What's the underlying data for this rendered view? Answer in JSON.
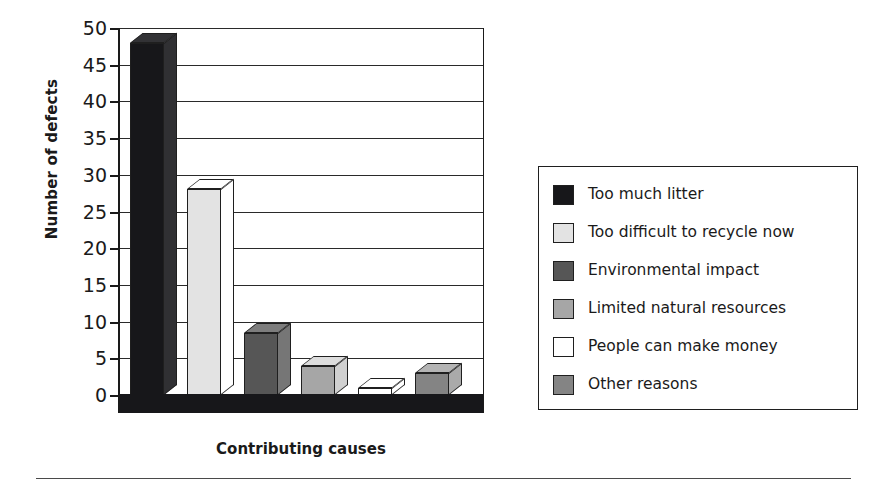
{
  "chart_data": {
    "type": "bar",
    "title": "",
    "subtitle": "",
    "xlabel": "Contributing causes",
    "ylabel": "Number of defects",
    "categories": [
      "Too much litter",
      "Too difficult to recycle now",
      "Environmental impact",
      "Limited natural resources",
      "People can make money",
      "Other reasons"
    ],
    "values": [
      48,
      28,
      8.5,
      4,
      1,
      3
    ],
    "ylim": [
      0,
      50
    ],
    "yticks": [
      0,
      5,
      10,
      15,
      20,
      25,
      30,
      35,
      40,
      45,
      50
    ],
    "ytick_labels": [
      "0",
      "5",
      "10",
      "15",
      "20",
      "25",
      "30",
      "35",
      "40",
      "45",
      "50"
    ],
    "xtick_labels": [],
    "grid": "horizontal",
    "legend_position": "right",
    "style": "3d-bars-grayscale",
    "series": [
      {
        "name": "Number of defects",
        "values": [
          48,
          28,
          8.5,
          4,
          1,
          3
        ]
      }
    ],
    "bar_colors": [
      "#17171a",
      "#e3e3e3",
      "#565656",
      "#a6a6a6",
      "#ffffff",
      "#848484"
    ]
  },
  "axes": {
    "y_title": "Number of defects",
    "x_title": "Contributing causes",
    "ticks": [
      {
        "label": "50",
        "value": 50
      },
      {
        "label": "45",
        "value": 45
      },
      {
        "label": "40",
        "value": 40
      },
      {
        "label": "35",
        "value": 35
      },
      {
        "label": "30",
        "value": 30
      },
      {
        "label": "25",
        "value": 25
      },
      {
        "label": "20",
        "value": 20
      },
      {
        "label": "15",
        "value": 15
      },
      {
        "label": "10",
        "value": 10
      },
      {
        "label": "5",
        "value": 5
      },
      {
        "label": "0",
        "value": 0
      }
    ]
  },
  "legend": {
    "items": [
      {
        "label": "Too much litter",
        "color": "#17171a"
      },
      {
        "label": "Too difficult to recycle now",
        "color": "#e3e3e3"
      },
      {
        "label": "Environmental impact",
        "color": "#565656"
      },
      {
        "label": "Limited natural resources",
        "color": "#a6a6a6"
      },
      {
        "label": "People can make money",
        "color": "#ffffff"
      },
      {
        "label": "Other reasons",
        "color": "#848484"
      }
    ]
  }
}
